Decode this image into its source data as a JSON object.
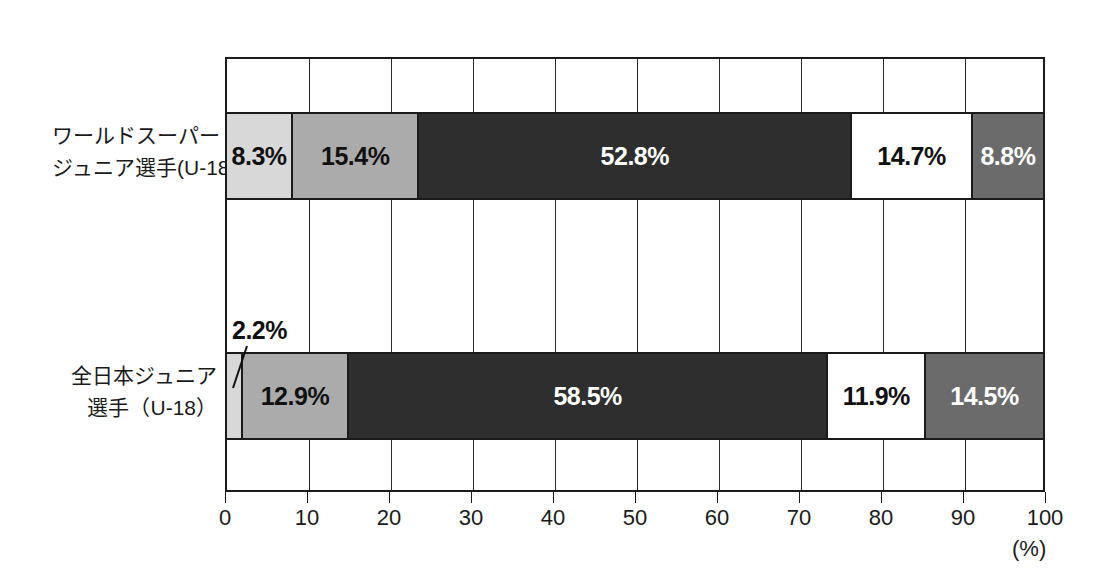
{
  "chart_data": {
    "type": "bar",
    "orientation": "horizontal",
    "stacked": true,
    "normalized_percent": true,
    "title": "",
    "subtitle": "",
    "xlabel": "(%)",
    "ylabel": "",
    "xlim": [
      0,
      100
    ],
    "grid": true,
    "legend": false,
    "legend_position": "none",
    "axis_unit": "(%)",
    "categories": [
      "ワールドスーパージュニア選手(U-18)",
      "全日本ジュニア選手（U-18）"
    ],
    "category_label_lines": [
      [
        "ワールドスーパー",
        "ジュニア選手(U-18)"
      ],
      [
        "全日本ジュニア",
        "選手（U-18）"
      ]
    ],
    "xticks": [
      0,
      10,
      20,
      30,
      40,
      50,
      60,
      70,
      80,
      90,
      100
    ],
    "xticklabels": [
      "0",
      "10",
      "20",
      "30",
      "40",
      "50",
      "60",
      "70",
      "80",
      "90",
      "100"
    ],
    "series": [
      {
        "name": "segment-1",
        "values": [
          8.3,
          2.2
        ],
        "labels": [
          "8.3%",
          "2.2%"
        ],
        "color": "#d8d8d8",
        "text_color": "#111111"
      },
      {
        "name": "segment-2",
        "values": [
          15.4,
          12.9
        ],
        "labels": [
          "15.4%",
          "12.9%"
        ],
        "color": "#ababab",
        "text_color": "#111111"
      },
      {
        "name": "segment-3",
        "values": [
          52.8,
          58.5
        ],
        "labels": [
          "52.8%",
          "58.5%"
        ],
        "color": "#2e2e2e",
        "text_color": "#ffffff"
      },
      {
        "name": "segment-4",
        "values": [
          14.7,
          11.9
        ],
        "labels": [
          "14.7%",
          "11.9%"
        ],
        "color": "#ffffff",
        "text_color": "#111111"
      },
      {
        "name": "segment-5",
        "values": [
          8.8,
          14.5
        ],
        "labels": [
          "8.8%",
          "14.5%"
        ],
        "color": "#6b6b6b",
        "text_color": "#ffffff"
      }
    ],
    "external_labels": [
      {
        "name": "callout-2-2-percent",
        "text": "2.2%",
        "belongs_to_category": "全日本ジュニア選手（U-18）",
        "belongs_to_series": "segment-1",
        "value": 2.2
      }
    ],
    "colors": {
      "segment_1": "#d8d8d8",
      "segment_2": "#ababab",
      "segment_3": "#2e2e2e",
      "segment_4": "#ffffff",
      "segment_5": "#6b6b6b",
      "axis": "#1b1b1b",
      "grid": "#2b2b2b",
      "background": "#ffffff"
    }
  }
}
